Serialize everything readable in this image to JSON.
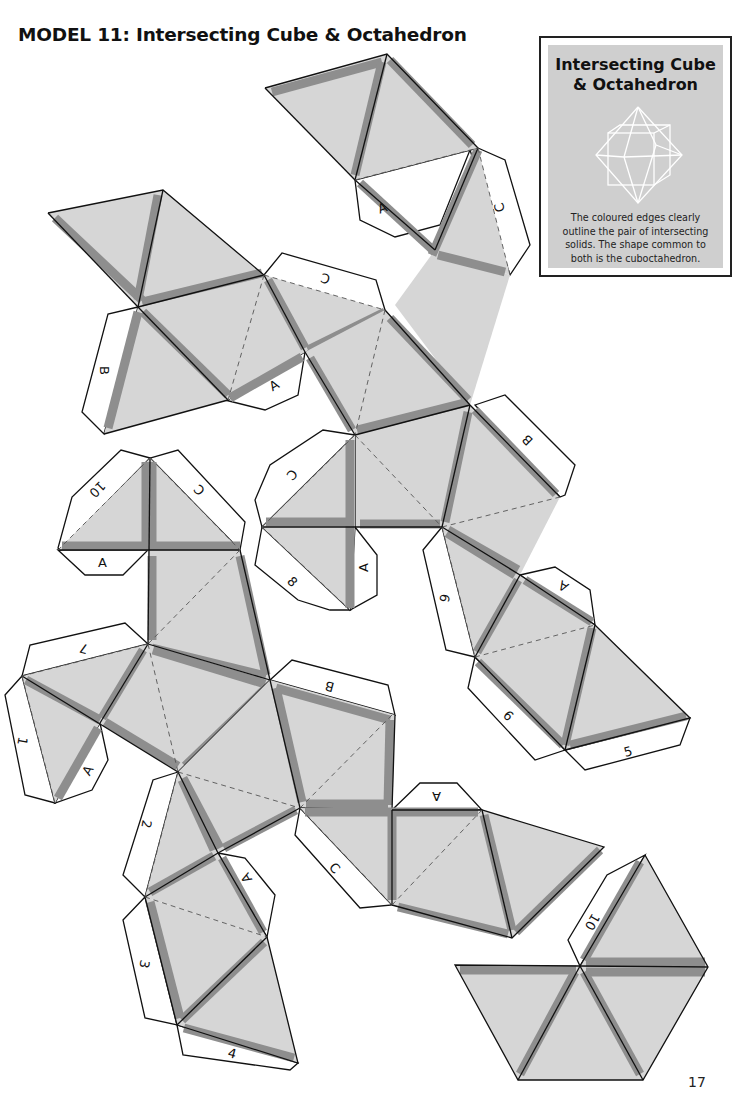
{
  "page": {
    "title": "MODEL 11: Intersecting Cube & Octahedron",
    "page_number": "17"
  },
  "infobox": {
    "title_line1": "Intersecting Cube",
    "title_line2": "& Octahedron",
    "figure": "wireframe-cube-octahedron-icon",
    "text_line1": "The coloured edges clearly",
    "text_line2": "outline the pair of intersecting",
    "text_line3": "solids. The shape common to",
    "text_line4": "both is the cuboctahedron."
  },
  "colors": {
    "face_fill": "#d6d6d6",
    "edge_band": "#8e8e8e",
    "outline": "#111111",
    "tab_fill": "#ffffff",
    "infobox_bg": "#cfcfcf"
  },
  "tabs": [
    {
      "label": "A",
      "note": "top piece lower tab"
    },
    {
      "label": "C",
      "note": "top piece right tab"
    },
    {
      "label": "C",
      "note": "upper-left piece top tab"
    },
    {
      "label": "B",
      "note": "upper-left piece left tab"
    },
    {
      "label": "A",
      "note": "upper-left piece bottom tab"
    },
    {
      "label": "B",
      "note": "center piece right tab"
    },
    {
      "label": "C",
      "note": "middle-left small piece"
    },
    {
      "label": "8",
      "note": "middle-left small piece"
    },
    {
      "label": "A",
      "note": "middle-left small piece"
    },
    {
      "label": "10",
      "note": "left piece top tab"
    },
    {
      "label": "C",
      "note": "left piece top tab"
    },
    {
      "label": "A",
      "note": "left piece tab"
    },
    {
      "label": "6",
      "note": "right chain tab"
    },
    {
      "label": "A",
      "note": "right chain tab"
    },
    {
      "label": "6",
      "note": "right chain lower tab"
    },
    {
      "label": "5",
      "note": "right chain bottom tab"
    },
    {
      "label": "7",
      "note": "lower-left tab"
    },
    {
      "label": "1",
      "note": "lower-left tab"
    },
    {
      "label": "A",
      "note": "lower-left tab"
    },
    {
      "label": "B",
      "note": "lower-center tab"
    },
    {
      "label": "2",
      "note": "bottom chain tab"
    },
    {
      "label": "A",
      "note": "bottom chain tab"
    },
    {
      "label": "3",
      "note": "bottom chain tab"
    },
    {
      "label": "4",
      "note": "bottom chain tab"
    },
    {
      "label": "A",
      "note": "lower-right piece tab"
    },
    {
      "label": "C",
      "note": "lower-right piece tab"
    },
    {
      "label": "10",
      "note": "hexagon piece tab"
    }
  ]
}
